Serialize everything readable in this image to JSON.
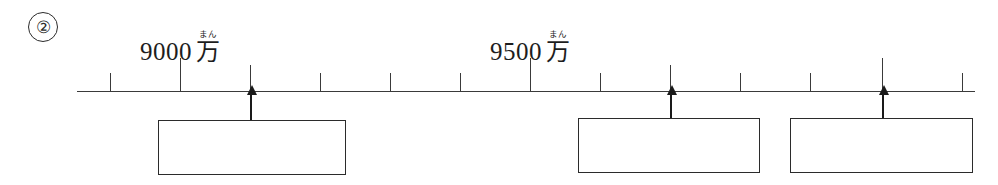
{
  "problem": {
    "number": "②"
  },
  "number_line": {
    "start_x": 77,
    "end_x": 975,
    "baseline_y": 91,
    "labels": [
      {
        "id": "label-9000",
        "numerals": "9000",
        "unit_kanji": "万",
        "unit_furigana": "まん",
        "value": 9000,
        "x": 180
      },
      {
        "id": "label-9500",
        "numerals": "9500",
        "unit_kanji": "万",
        "unit_furigana": "まん",
        "value": 9500,
        "x": 530
      }
    ],
    "ticks": [
      {
        "x": 110,
        "size": "minor"
      },
      {
        "x": 180,
        "size": "major"
      },
      {
        "x": 250,
        "size": "medium"
      },
      {
        "x": 320,
        "size": "minor"
      },
      {
        "x": 390,
        "size": "minor"
      },
      {
        "x": 460,
        "size": "minor"
      },
      {
        "x": 530,
        "size": "major"
      },
      {
        "x": 600,
        "size": "minor"
      },
      {
        "x": 670,
        "size": "medium"
      },
      {
        "x": 740,
        "size": "minor"
      },
      {
        "x": 810,
        "size": "minor"
      },
      {
        "x": 882,
        "size": "major"
      },
      {
        "x": 962,
        "size": "minor"
      }
    ]
  },
  "answer_boxes": [
    {
      "id": "answer-box-1",
      "value": "",
      "left": 158,
      "top": 120,
      "width": 188,
      "height": 55,
      "arrow_x": 250,
      "arrow_top": 93,
      "arrow_height": 27
    },
    {
      "id": "answer-box-2",
      "value": "",
      "left": 578,
      "top": 118,
      "width": 182,
      "height": 55,
      "arrow_x": 670,
      "arrow_top": 93,
      "arrow_height": 25
    },
    {
      "id": "answer-box-3",
      "value": "",
      "left": 790,
      "top": 118,
      "width": 183,
      "height": 55,
      "arrow_x": 882,
      "arrow_top": 93,
      "arrow_height": 25
    }
  ],
  "colors": {
    "ink": "#2b2b2b",
    "line": "#3a3a3a",
    "arrow": "#1a1a1a",
    "paper": "#ffffff"
  }
}
